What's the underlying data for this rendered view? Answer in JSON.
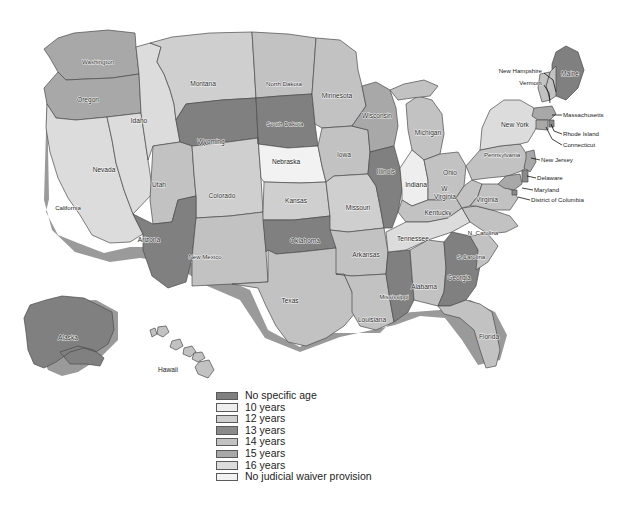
{
  "map": {
    "title": "Age at which juveniles may be judicially waived to criminal court, by state",
    "projection_note": "United States choropleth, grayscale",
    "outline_color": "#4a4a4a",
    "shadow_color": "#9a9a9a",
    "background": "#ffffff"
  },
  "categories": [
    {
      "key": "no_specific_age",
      "label": "No specific age",
      "color": "#808080"
    },
    {
      "key": "age10",
      "label": "10 years",
      "color": "#eeeeee"
    },
    {
      "key": "age12",
      "label": "12 years",
      "color": "#cfcfcf"
    },
    {
      "key": "age13",
      "label": "13 years",
      "color": "#8a8a8a"
    },
    {
      "key": "age14",
      "label": "14 years",
      "color": "#c2c2c2"
    },
    {
      "key": "age15",
      "label": "15 years",
      "color": "#a8a8a8"
    },
    {
      "key": "age16",
      "label": "16 years",
      "color": "#dcdcdc"
    },
    {
      "key": "none",
      "label": "No judicial waiver provision",
      "color": "#f2f2f2"
    }
  ],
  "legend": {
    "name": "map-legend",
    "items": [
      {
        "label": "No specific age",
        "color": "#808080"
      },
      {
        "label": "10 years",
        "color": "#eeeeee"
      },
      {
        "label": "12 years",
        "color": "#cfcfcf"
      },
      {
        "label": "13 years",
        "color": "#8a8a8a"
      },
      {
        "label": "14 years",
        "color": "#c2c2c2"
      },
      {
        "label": "15 years",
        "color": "#a8a8a8"
      },
      {
        "label": "16 years",
        "color": "#dcdcdc"
      },
      {
        "label": "No judicial waiver provision",
        "color": "#f2f2f2"
      }
    ]
  },
  "states": [
    {
      "id": "WA",
      "label": "Washington",
      "category": "age15",
      "color": "#a8a8a8",
      "label_x": 98,
      "label_y": 62
    },
    {
      "id": "OR",
      "label": "Oregon",
      "category": "age15",
      "color": "#a8a8a8",
      "label_x": 88,
      "label_y": 100
    },
    {
      "id": "CA",
      "label": "California",
      "category": "age16",
      "color": "#dcdcdc",
      "label_x": 68,
      "label_y": 208
    },
    {
      "id": "NV",
      "label": "Nevada",
      "category": "age16",
      "color": "#dcdcdc",
      "label_x": 104,
      "label_y": 170
    },
    {
      "id": "ID",
      "label": "Idaho",
      "category": "age16",
      "color": "#dcdcdc",
      "label_x": 139,
      "label_y": 121
    },
    {
      "id": "MT",
      "label": "Montana",
      "category": "age12",
      "color": "#cfcfcf",
      "label_x": 203,
      "label_y": 84
    },
    {
      "id": "WY",
      "label": "Wyoming",
      "category": "no_specific_age",
      "color": "#808080",
      "label_x": 211,
      "label_y": 142
    },
    {
      "id": "UT",
      "label": "Utah",
      "category": "age14",
      "color": "#c2c2c2",
      "label_x": 159,
      "label_y": 185
    },
    {
      "id": "CO",
      "label": "Colorado",
      "category": "age12",
      "color": "#cfcfcf",
      "label_x": 222,
      "label_y": 196
    },
    {
      "id": "AZ",
      "label": "Arizona",
      "category": "no_specific_age",
      "color": "#808080",
      "label_x": 149,
      "label_y": 240
    },
    {
      "id": "NM",
      "label": "New Mexico",
      "category": "age14",
      "color": "#c2c2c2",
      "label_x": 205,
      "label_y": 257
    },
    {
      "id": "ND",
      "label": "North Dakota",
      "category": "age14",
      "color": "#c2c2c2",
      "label_x": 284,
      "label_y": 84
    },
    {
      "id": "SD",
      "label": "South Dakota",
      "category": "no_specific_age",
      "color": "#808080",
      "label_x": 285,
      "label_y": 124
    },
    {
      "id": "NE",
      "label": "Nebraska",
      "category": "none",
      "color": "#f2f2f2",
      "label_x": 286,
      "label_y": 162
    },
    {
      "id": "KS",
      "label": "Kansas",
      "category": "age12",
      "color": "#cfcfcf",
      "label_x": 296,
      "label_y": 201
    },
    {
      "id": "OK",
      "label": "Oklahoma",
      "category": "no_specific_age",
      "color": "#808080",
      "label_x": 305,
      "label_y": 241
    },
    {
      "id": "TX",
      "label": "Texas",
      "category": "age14",
      "color": "#c2c2c2",
      "label_x": 290,
      "label_y": 301
    },
    {
      "id": "MN",
      "label": "Minnesota",
      "category": "age14",
      "color": "#c2c2c2",
      "label_x": 337,
      "label_y": 96
    },
    {
      "id": "IA",
      "label": "Iowa",
      "category": "age14",
      "color": "#c2c2c2",
      "label_x": 344,
      "label_y": 155
    },
    {
      "id": "MO",
      "label": "Missouri",
      "category": "age12",
      "color": "#cfcfcf",
      "label_x": 358,
      "label_y": 208
    },
    {
      "id": "AR",
      "label": "Arkansas",
      "category": "age14",
      "color": "#c2c2c2",
      "label_x": 366,
      "label_y": 255
    },
    {
      "id": "LA",
      "label": "Louisiana",
      "category": "age14",
      "color": "#c2c2c2",
      "label_x": 372,
      "label_y": 320
    },
    {
      "id": "WI",
      "label": "Wisconsin",
      "category": "age15",
      "color": "#a8a8a8",
      "label_x": 377,
      "label_y": 116
    },
    {
      "id": "IL",
      "label": "Illinois",
      "category": "no_specific_age",
      "color": "#808080",
      "label_x": 386,
      "label_y": 172
    },
    {
      "id": "MS",
      "label": "Mississippi",
      "category": "no_specific_age",
      "color": "#808080",
      "label_x": 394,
      "label_y": 297
    },
    {
      "id": "MI",
      "label": "Michigan",
      "category": "age14",
      "color": "#c2c2c2",
      "label_x": 428,
      "label_y": 133
    },
    {
      "id": "IN",
      "label": "Indiana",
      "category": "age10",
      "color": "#eeeeee",
      "label_x": 416,
      "label_y": 185
    },
    {
      "id": "TN",
      "label": "Tennessee",
      "category": "age16",
      "color": "#dcdcdc",
      "label_x": 413,
      "label_y": 239
    },
    {
      "id": "AL",
      "label": "Alabama",
      "category": "age14",
      "color": "#c2c2c2",
      "label_x": 424,
      "label_y": 287
    },
    {
      "id": "OH",
      "label": "Ohio",
      "category": "age14",
      "color": "#c2c2c2",
      "label_x": 450,
      "label_y": 173
    },
    {
      "id": "KY",
      "label": "Kentucky",
      "category": "age14",
      "color": "#c2c2c2",
      "label_x": 438,
      "label_y": 213
    },
    {
      "id": "FL",
      "label": "Florida",
      "category": "age14",
      "color": "#c2c2c2",
      "label_x": 489,
      "label_y": 337
    },
    {
      "id": "GA",
      "label": "Georgia",
      "category": "no_specific_age",
      "color": "#808080",
      "label_x": 459,
      "label_y": 278
    },
    {
      "id": "SC",
      "label": "S.Carolina",
      "category": "age14",
      "color": "#c2c2c2",
      "label_x": 471,
      "label_y": 257
    },
    {
      "id": "NC",
      "label": "N. Carolina",
      "category": "age14",
      "color": "#c2c2c2",
      "label_x": 483,
      "label_y": 233
    },
    {
      "id": "WV",
      "label": "W.",
      "category": "age14",
      "color": "#c2c2c2",
      "label_x": 445,
      "label_y": 189
    },
    {
      "id": "WV2",
      "label": "Virginia",
      "category": "age14",
      "color": "#c2c2c2",
      "label_x": 445,
      "label_y": 197
    },
    {
      "id": "VA",
      "label": "Virginia",
      "category": "age14",
      "color": "#c2c2c2",
      "label_x": 487,
      "label_y": 200
    },
    {
      "id": "PA",
      "label": "Pennsylvania",
      "category": "age14",
      "color": "#c2c2c2",
      "label_x": 502,
      "label_y": 155
    },
    {
      "id": "NY",
      "label": "New York",
      "category": "age16",
      "color": "#dcdcdc",
      "label_x": 515,
      "label_y": 125
    },
    {
      "id": "ME",
      "label": "Maine",
      "category": "no_specific_age",
      "color": "#808080",
      "label_x": 570,
      "label_y": 74
    },
    {
      "id": "AK",
      "label": "Alaska",
      "category": "no_specific_age",
      "color": "#808080",
      "label_x": 68,
      "label_y": 338
    },
    {
      "id": "HI",
      "label": "Hawaii",
      "category": "age14",
      "color": "#c2c2c2",
      "label_x": 168,
      "label_y": 370
    }
  ],
  "callouts": [
    {
      "id": "NH",
      "label": "New Hampshire",
      "anchor": "right",
      "text_x": 542,
      "text_y": 71,
      "path": "M544,73 L553,80 L556,92"
    },
    {
      "id": "VT",
      "label": "Vermont",
      "anchor": "right",
      "text_x": 542,
      "text_y": 83,
      "path": "M544,85 L549,93 L550,103"
    },
    {
      "id": "MA",
      "label": "Massachusetts",
      "anchor": "left",
      "text_x": 563,
      "text_y": 115,
      "path": "M562,115 L552,115"
    },
    {
      "id": "RI",
      "label": "Rhode Island",
      "anchor": "left",
      "text_x": 563,
      "text_y": 134,
      "path": "M562,134 L554,131 L551,124"
    },
    {
      "id": "CT",
      "label": "Connecticut",
      "anchor": "left",
      "text_x": 563,
      "text_y": 145,
      "path": "M562,145 L552,139 L546,127"
    },
    {
      "id": "NJ",
      "label": "New Jersey",
      "anchor": "left",
      "text_x": 541,
      "text_y": 160,
      "path": "M540,160 L531,158"
    },
    {
      "id": "DE",
      "label": "Delaware",
      "anchor": "left",
      "text_x": 537,
      "text_y": 178,
      "path": "M536,178 L527,176"
    },
    {
      "id": "MD",
      "label": "Maryland",
      "anchor": "left",
      "text_x": 534,
      "text_y": 190,
      "path": "M533,190 L522,188"
    },
    {
      "id": "DC",
      "label": "District of Columbia",
      "anchor": "left",
      "text_x": 531,
      "text_y": 200,
      "path": "M530,200 L518,197"
    }
  ]
}
